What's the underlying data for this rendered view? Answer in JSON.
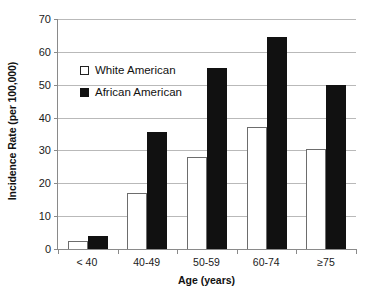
{
  "chart_data": {
    "type": "bar",
    "title": "",
    "xlabel": "Age (years)",
    "ylabel": "Incidence Rate (per 100,000)",
    "categories": [
      "< 40",
      "40-49",
      "50-59",
      "60-74",
      "≥75"
    ],
    "series": [
      {
        "name": "White American",
        "values": [
          2.5,
          17,
          28,
          37,
          30.5
        ],
        "color": "#ffffff",
        "edge_color": "#6d6d6d"
      },
      {
        "name": "African American",
        "values": [
          4,
          35.5,
          55,
          64.5,
          50
        ],
        "color": "#111111",
        "edge_color": "#111111"
      }
    ],
    "ylim": [
      0,
      70
    ],
    "yticks": [
      0,
      10,
      20,
      30,
      40,
      50,
      60,
      70
    ],
    "ytick_labels": [
      "0",
      "10",
      "20",
      "30",
      "40",
      "50",
      "60",
      "70"
    ],
    "grid": true,
    "grid_axis": "y",
    "legend_position": "upper-left-inside",
    "bar_group_gap": true
  },
  "legend": {
    "items": [
      {
        "label": "White American",
        "marker": "open-square"
      },
      {
        "label": "African American",
        "marker": "filled-square"
      }
    ]
  }
}
